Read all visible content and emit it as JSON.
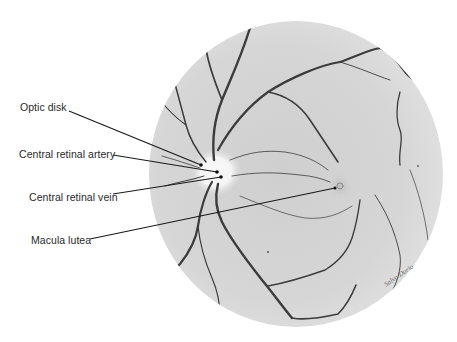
{
  "figure": {
    "background": "#ffffff",
    "fundus_color": "#d2d2d2",
    "vessel_color": "#3c3c3c",
    "optic_disk_color": "#f2f2f2",
    "leader_line_color": "#1a1a1a"
  },
  "labels": [
    {
      "id": "optic-disk",
      "text": "Optic disk"
    },
    {
      "id": "central-retinal-artery",
      "text": "Central retinal artery"
    },
    {
      "id": "central-retinal-vein",
      "text": "Central retinal vein"
    },
    {
      "id": "macula-lutea",
      "text": "Macula lutea"
    }
  ],
  "signature": "Salvo Dorio"
}
